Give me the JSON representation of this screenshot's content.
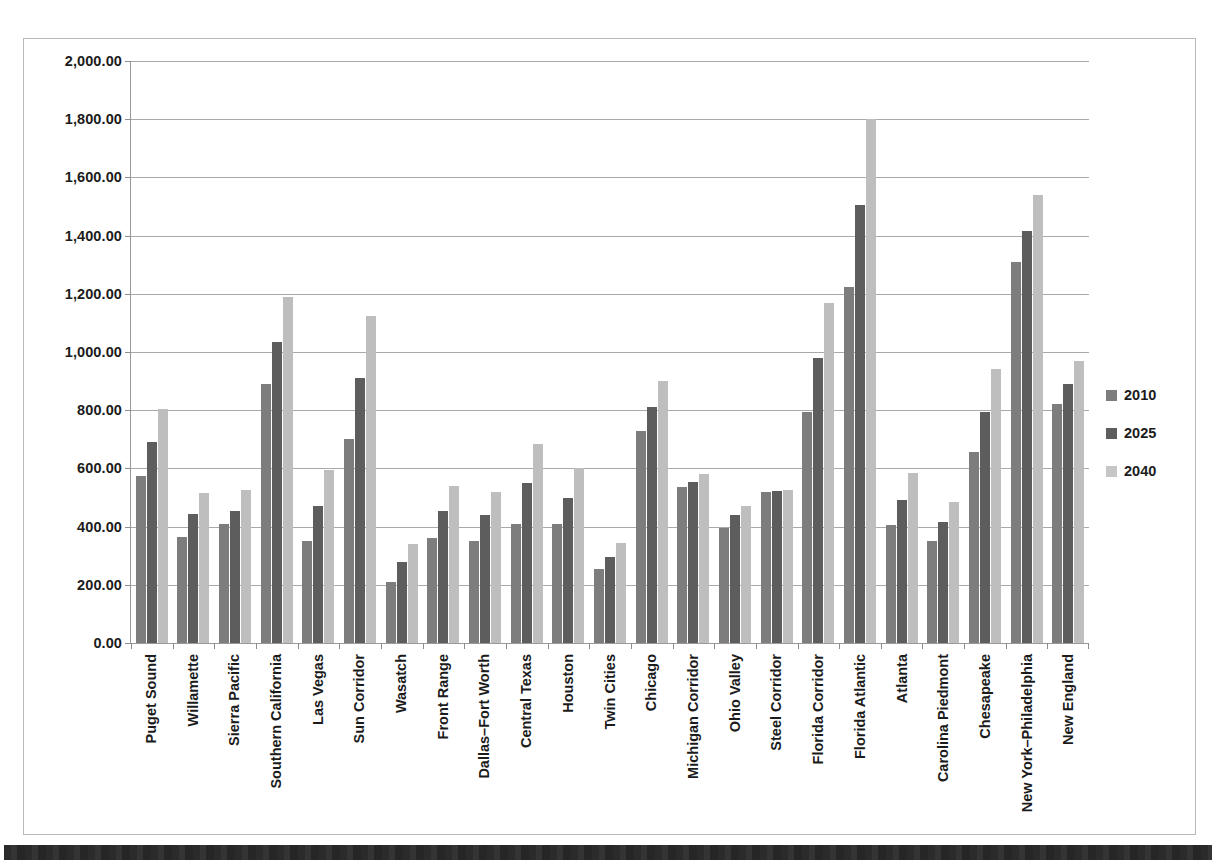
{
  "chart_data": {
    "type": "bar",
    "title": "",
    "xlabel": "",
    "ylabel": "",
    "ylim": [
      0,
      2000
    ],
    "grid": true,
    "legend_position": "right",
    "ytick_labels": [
      "0.00",
      "200.00",
      "400.00",
      "600.00",
      "800.00",
      "1,000.00",
      "1,200.00",
      "1,400.00",
      "1,600.00",
      "1,800.00",
      "2,000.00"
    ],
    "ytick_values": [
      0,
      200,
      400,
      600,
      800,
      1000,
      1200,
      1400,
      1600,
      1800,
      2000
    ],
    "categories": [
      "Puget Sound",
      "Willamette",
      "Sierra Pacific",
      "Southern California",
      "Las Vegas",
      "Sun Corridor",
      "Wasatch",
      "Front Range",
      "Dallas–Fort Worth",
      "Central Texas",
      "Houston",
      "Twin Cities",
      "Chicago",
      "Michigan Corridor",
      "Ohio Valley",
      "Steel Corridor",
      "Florida Corridor",
      "Florida Atlantic",
      "Atlanta",
      "Carolina Piedmont",
      "Chesapeake",
      "New York–Philadelphia",
      "New England"
    ],
    "series": [
      {
        "name": "2010",
        "color": "#7d7d7d",
        "values": [
          575,
          365,
          410,
          890,
          350,
          700,
          210,
          360,
          350,
          410,
          410,
          255,
          730,
          535,
          395,
          520,
          795,
          1225,
          405,
          350,
          655,
          1310,
          820
        ]
      },
      {
        "name": "2025",
        "color": "#5d5d5d",
        "values": [
          690,
          445,
          455,
          1035,
          470,
          910,
          280,
          455,
          440,
          550,
          500,
          295,
          810,
          555,
          440,
          522,
          980,
          1505,
          490,
          415,
          795,
          1415,
          890
        ]
      },
      {
        "name": "2040",
        "color": "#bebebe",
        "values": [
          805,
          515,
          525,
          1190,
          595,
          1125,
          340,
          540,
          520,
          685,
          600,
          345,
          900,
          580,
          470,
          525,
          1170,
          1800,
          585,
          485,
          940,
          1540,
          970
        ]
      }
    ]
  }
}
